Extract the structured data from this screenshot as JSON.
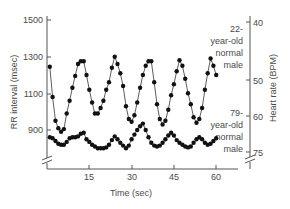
{
  "chart_data": {
    "type": "line",
    "title": "",
    "xlabel": "Time (sec)",
    "ylabel": "RR interval (msec)",
    "ylabel_right": "Heart rate (BPM)",
    "xlim": [
      0,
      63
    ],
    "ylim": [
      750,
      1520
    ],
    "x_ticks": [
      15,
      30,
      45,
      60
    ],
    "y_ticks": [
      900,
      1100,
      1300,
      1500
    ],
    "y_right_ticks": [
      {
        "label": "40",
        "rr": 1500
      },
      {
        "label": "50",
        "rr": 1200
      },
      {
        "label": "60",
        "rr": 1000
      },
      {
        "label": "75",
        "rr": 800
      }
    ],
    "grid": false,
    "legend": "annotations at right",
    "series": [
      {
        "name": "22-year-old normal male",
        "x": [
          1,
          2,
          3,
          4,
          5,
          6,
          7,
          8,
          9,
          10,
          11,
          12,
          13,
          14,
          15,
          16,
          17,
          18,
          19,
          20,
          21,
          22,
          23,
          24,
          25,
          26,
          27,
          28,
          29,
          30,
          31,
          32,
          33,
          34,
          35,
          36,
          37,
          38,
          39,
          40,
          41,
          42,
          43,
          44,
          45,
          46,
          47,
          48,
          49,
          50,
          51,
          52,
          53,
          54,
          55,
          56,
          57,
          58,
          59,
          60
        ],
        "values": [
          1245,
          1080,
          950,
          910,
          890,
          905,
          990,
          1060,
          1130,
          1195,
          1260,
          1275,
          1275,
          1200,
          1120,
          1050,
          990,
          990,
          1020,
          1060,
          1120,
          1160,
          1240,
          1300,
          1260,
          1210,
          1140,
          1030,
          960,
          945,
          980,
          1050,
          1130,
          1200,
          1250,
          1275,
          1275,
          1160,
          1040,
          960,
          930,
          950,
          1010,
          1090,
          1150,
          1220,
          1280,
          1250,
          1180,
          1100,
          1040,
          970,
          940,
          960,
          1020,
          1120,
          1210,
          1290,
          1250,
          1200
        ]
      },
      {
        "name": "79-year-old normal male",
        "x": [
          1,
          2,
          3,
          4,
          5,
          6,
          7,
          8,
          9,
          10,
          11,
          12,
          13,
          14,
          15,
          16,
          17,
          18,
          19,
          20,
          21,
          22,
          23,
          24,
          25,
          26,
          27,
          28,
          29,
          30,
          31,
          32,
          33,
          34,
          35,
          36,
          37,
          38,
          39,
          40,
          41,
          42,
          43,
          44,
          45,
          46,
          47,
          48,
          49,
          50,
          51,
          52,
          53,
          54,
          55,
          56,
          57,
          58,
          59,
          60
        ],
        "values": [
          860,
          855,
          840,
          825,
          820,
          820,
          835,
          855,
          860,
          860,
          865,
          880,
          885,
          850,
          835,
          820,
          810,
          800,
          800,
          800,
          805,
          820,
          845,
          865,
          850,
          830,
          815,
          800,
          815,
          850,
          875,
          900,
          920,
          935,
          900,
          860,
          830,
          815,
          810,
          815,
          830,
          850,
          870,
          885,
          870,
          845,
          830,
          820,
          810,
          805,
          810,
          830,
          850,
          860,
          850,
          830,
          820,
          825,
          840,
          855
        ]
      }
    ],
    "annotations": [
      {
        "lines": [
          "22-",
          "year-old",
          "normal",
          "male"
        ]
      },
      {
        "lines": [
          "79-",
          "year-old",
          "normal",
          "male"
        ]
      }
    ]
  },
  "labels": {
    "y_ticks": [
      "1500",
      "1300",
      "1100",
      "900"
    ],
    "x_ticks": [
      "15",
      "30",
      "45",
      "60"
    ],
    "y_right_ticks": [
      "40",
      "50",
      "60",
      "75"
    ],
    "xlabel": "Time (sec)",
    "ylabel": "RR interval (msec)",
    "ylabel_right": "Heart rate (BPM)",
    "annot_young": [
      "22-",
      "year-old",
      "normal",
      "male"
    ],
    "annot_old": [
      "79-",
      "year-old",
      "normal",
      "male"
    ]
  }
}
